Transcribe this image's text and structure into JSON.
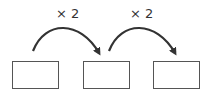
{
  "diagram": {
    "boxes": [
      "",
      "",
      ""
    ],
    "arrows": [
      {
        "label": "× 2",
        "from": 0,
        "to": 1
      },
      {
        "label": "× 2",
        "from": 1,
        "to": 2
      }
    ]
  }
}
